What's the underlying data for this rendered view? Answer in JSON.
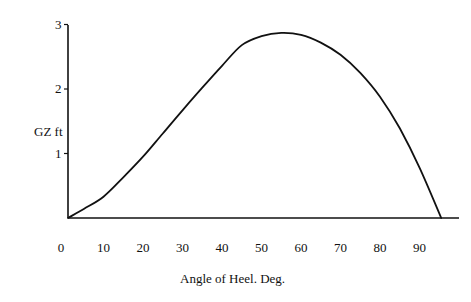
{
  "chart_data": {
    "type": "line",
    "title": "",
    "xlabel": "Angle of Heel. Deg.",
    "ylabel": "GZ ft",
    "xlim": [
      0,
      97
    ],
    "ylim": [
      0,
      3
    ],
    "grid": false,
    "legend": null,
    "x_ticks": [
      0,
      10,
      20,
      30,
      40,
      50,
      60,
      70,
      80,
      90
    ],
    "x_tick_labels": [
      "0",
      "10",
      "20",
      "30",
      "40",
      "50",
      "60",
      "70",
      "80",
      "90"
    ],
    "y_ticks": [
      1,
      2,
      3
    ],
    "y_tick_labels": [
      "1",
      "2",
      "3"
    ],
    "series": [
      {
        "name": "GZ curve",
        "color": "#111111",
        "x": [
          1,
          5,
          10,
          15,
          20,
          25,
          30,
          35,
          40,
          45,
          50,
          55,
          60,
          65,
          70,
          75,
          80,
          85,
          90,
          95.5
        ],
        "y": [
          0,
          0.14,
          0.33,
          0.63,
          0.95,
          1.31,
          1.67,
          2.02,
          2.36,
          2.68,
          2.82,
          2.87,
          2.84,
          2.72,
          2.53,
          2.25,
          1.88,
          1.39,
          0.78,
          0
        ]
      }
    ]
  }
}
